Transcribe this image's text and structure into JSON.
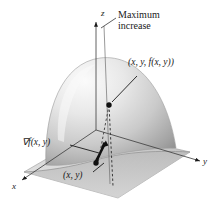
{
  "figure": {
    "background_color": "#ffffff",
    "ink_color": "#1a1a1a",
    "labels": {
      "maximum_increase": "Maximum increase",
      "surface_point": "(x, y, f(x, y))",
      "gradient": "∇f(x, y)",
      "base_point": "(x, y)",
      "axis_z": "z",
      "axis_y": "y",
      "axis_x": "x"
    },
    "surface": {
      "name": "dome-surface",
      "shading_light": "#f3f3f3",
      "shading_mid": "#c9c9c9",
      "shading_dark": "#8e8e8e"
    },
    "plane": {
      "name": "xy-plane",
      "fill_light": "#efefef",
      "fill_shadow": "#bdbdbd"
    },
    "markers": {
      "surface_point_color": "#111111",
      "base_point_color": "#111111",
      "gradient_vector_color": "#111111"
    },
    "lines": {
      "dashed_projection": "dashed",
      "axis_style": "solid-thin"
    }
  }
}
